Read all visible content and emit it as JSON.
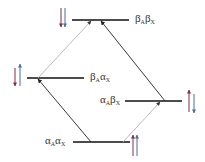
{
  "diagram": {
    "type": "energy-level diagram (AX two-spin system)",
    "levels": [
      {
        "id": "bb",
        "greek1": "β",
        "sub1": "A",
        "greek2": "β",
        "sub2": "X",
        "spins": "down-down"
      },
      {
        "id": "ba",
        "greek1": "β",
        "sub1": "A",
        "greek2": "α",
        "sub2": "X",
        "spins": "down-up"
      },
      {
        "id": "ab",
        "greek1": "α",
        "sub1": "A",
        "greek2": "β",
        "sub2": "X",
        "spins": "up-down"
      },
      {
        "id": "aa",
        "greek1": "α",
        "sub1": "A",
        "greek2": "α",
        "sub2": "X",
        "spins": "up-up"
      }
    ],
    "transitions": [
      {
        "from": "aa",
        "to": "ba",
        "style": "dark"
      },
      {
        "from": "aa",
        "to": "ab",
        "style": "light"
      },
      {
        "from": "ba",
        "to": "bb",
        "style": "light"
      },
      {
        "from": "ab",
        "to": "bb",
        "style": "dark"
      }
    ],
    "colors": {
      "spinA": "#8a2a4a",
      "spinX": "#4a6f9a",
      "dark": "#222222",
      "light": "#aaaaaa"
    }
  }
}
